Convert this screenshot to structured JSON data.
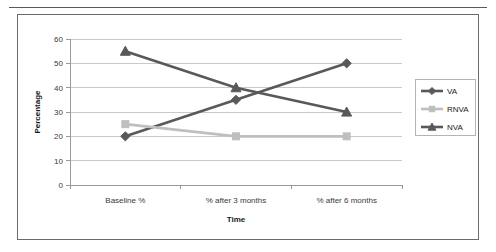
{
  "chart_data": {
    "type": "line",
    "title": "",
    "xlabel": "Time",
    "ylabel": "Percentage",
    "categories": [
      "Baseline %",
      "% after 3 months",
      "% after 6 months"
    ],
    "series": [
      {
        "name": "VA",
        "values": [
          20,
          35,
          50
        ],
        "color": "#595959",
        "marker": "diamond"
      },
      {
        "name": "RNVA",
        "values": [
          25,
          20,
          20
        ],
        "color": "#bfbfbf",
        "marker": "square"
      },
      {
        "name": "NVA",
        "values": [
          55,
          40,
          30
        ],
        "color": "#595959",
        "marker": "triangle"
      }
    ],
    "ylim": [
      0,
      60
    ],
    "yticks": [
      0,
      10,
      20,
      30,
      40,
      50,
      60
    ],
    "ytick_labels": [
      "0",
      "10",
      "20",
      "30",
      "40",
      "50",
      "60"
    ],
    "grid": true,
    "legend_position": "right",
    "legend_entries": [
      "VA",
      "RNVA",
      "NVA"
    ]
  },
  "axes": {
    "y_title": "Percentage",
    "x_title": "Time"
  }
}
